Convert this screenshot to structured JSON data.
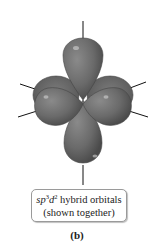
{
  "figure": {
    "title": "sp3d2 hybrid orbitals",
    "caption": {
      "hybrid_prefix_sp": "sp",
      "sup_3": "3",
      "hybrid_d": "d",
      "sup_2": "2",
      "line1_rest": " hybrid orbitals",
      "line2": "(shown together)"
    },
    "panel_label": "(b)",
    "geometry": "octahedral",
    "lobe_count": 6,
    "colors": {
      "lobe_fill": "#6e6e6e",
      "lobe_dark": "#4a4a4a",
      "lobe_highlight": "#bdbdbd",
      "axis_line": "#111111",
      "box_border": "#9a9a9a"
    }
  }
}
